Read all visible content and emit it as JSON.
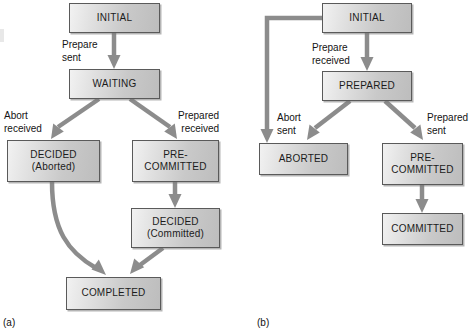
{
  "figure": {
    "background": "#ffffff",
    "node_fill": "#d2d2d2",
    "node_border": "#5a5a5a",
    "connector_color": "#8c8c8c",
    "text_color": "#141414"
  },
  "panels": [
    {
      "id": "a",
      "caption": "(a)",
      "nodes": [
        {
          "id": "a-initial",
          "line1": "INITIAL",
          "line2": ""
        },
        {
          "id": "a-waiting",
          "line1": "WAITING",
          "line2": ""
        },
        {
          "id": "a-decided-ab",
          "line1": "DECIDED",
          "line2": "(Aborted)"
        },
        {
          "id": "a-precommit",
          "line1": "PRE-",
          "line2": "COMMITTED"
        },
        {
          "id": "a-decided-cm",
          "line1": "DECIDED",
          "line2": "(Committed)"
        },
        {
          "id": "a-completed",
          "line1": "COMPLETED",
          "line2": ""
        }
      ],
      "edge_labels": [
        {
          "id": "a-prepare-sent",
          "line1": "Prepare",
          "line2": "sent"
        },
        {
          "id": "a-abort-received",
          "line1": "Abort",
          "line2": "received"
        },
        {
          "id": "a-prepared-received",
          "line1": "Prepared",
          "line2": "received"
        }
      ]
    },
    {
      "id": "b",
      "caption": "(b)",
      "nodes": [
        {
          "id": "b-initial",
          "line1": "INITIAL",
          "line2": ""
        },
        {
          "id": "b-prepared",
          "line1": "PREPARED",
          "line2": ""
        },
        {
          "id": "b-aborted",
          "line1": "ABORTED",
          "line2": ""
        },
        {
          "id": "b-precommit",
          "line1": "PRE-",
          "line2": "COMMITTED"
        },
        {
          "id": "b-committed",
          "line1": "COMMITTED",
          "line2": ""
        }
      ],
      "edge_labels": [
        {
          "id": "b-prepare-received",
          "line1": "Prepare",
          "line2": "received"
        },
        {
          "id": "b-abort-sent",
          "line1": "Abort",
          "line2": "sent"
        },
        {
          "id": "b-prepared-sent",
          "line1": "Prepared",
          "line2": "sent"
        }
      ]
    }
  ]
}
